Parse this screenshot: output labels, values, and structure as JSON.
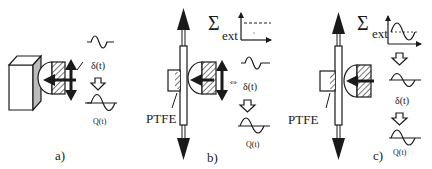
{
  "figure": {
    "panels": [
      {
        "id": "a",
        "caption": "a)",
        "signals": {
          "input_label": "δ(t)",
          "output_label": "Q(t)"
        }
      },
      {
        "id": "b",
        "caption": "b)",
        "material_label": "PTFE",
        "excitation": {
          "sigma_symbol": "Σ",
          "sigma_subscript": "ext"
        },
        "coupling_symbol": "⇔",
        "signals": {
          "input_label": "δ(t)",
          "output_label": "Q(t)"
        }
      },
      {
        "id": "c",
        "caption": "c)",
        "material_label": "PTFE",
        "excitation": {
          "sigma_symbol": "Σ",
          "sigma_subscript": "ext"
        },
        "signals": {
          "input_label": "δ(t)",
          "output_label": "Q(t)"
        }
      }
    ],
    "colors": {
      "ink": "#1a1a1a",
      "background": "#ffffff",
      "wall_shade": "#bbbbbb"
    }
  }
}
